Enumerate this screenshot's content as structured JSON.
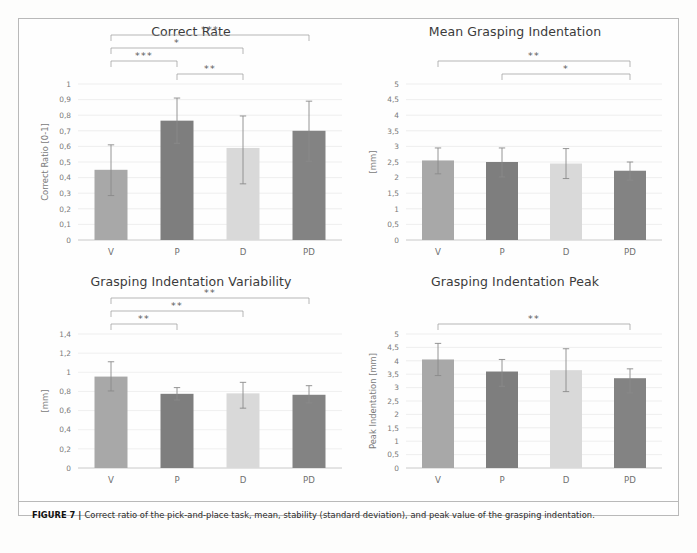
{
  "figure": {
    "caption_label": "FIGURE 7 |",
    "caption_text": "Correct ratio of the pick-and-place task, mean, stability (standard deviation), and peak value of the grasping indentation."
  },
  "palette": {
    "bar_v": "#a8a8a8",
    "bar_p": "#7e7e7e",
    "bar_d": "#d9d9d9",
    "bar_pd": "#838383",
    "grid": "#e8e8e8",
    "axis": "#c9c9c9",
    "error": "#8a8a8a",
    "bracket": "#9a9a9a",
    "text": "#7a7a7a",
    "title": "#3b3b3b"
  },
  "chart_data": [
    {
      "id": "correct-rate",
      "type": "bar",
      "title": "Correct Rate",
      "xlabel": "",
      "ylabel": "Correct Ratio [0-1]",
      "categories": [
        "V",
        "P",
        "D",
        "PD"
      ],
      "values": [
        0.45,
        0.765,
        0.59,
        0.7
      ],
      "errors_low": [
        0.165,
        0.145,
        0.23,
        0.195
      ],
      "errors_high": [
        0.16,
        0.145,
        0.205,
        0.19
      ],
      "ylim": [
        0,
        1
      ],
      "yticks": [
        0,
        0.1,
        0.2,
        0.3,
        0.4,
        0.5,
        0.6,
        0.7,
        0.8,
        0.9,
        1
      ],
      "ytick_labels": [
        "0",
        "0,1",
        "0,2",
        "0,3",
        "0,4",
        "0,5",
        "0,6",
        "0,7",
        "0,8",
        "0,9",
        "1"
      ],
      "grid": true,
      "legend": "none",
      "significance": [
        {
          "from": "V",
          "to": "PD",
          "label": "***",
          "level": 3
        },
        {
          "from": "V",
          "to": "D",
          "label": "*",
          "level": 2
        },
        {
          "from": "V",
          "to": "P",
          "label": "***",
          "level": 1
        },
        {
          "from": "P",
          "to": "D",
          "label": "**",
          "level": 0
        }
      ]
    },
    {
      "id": "mean-grasping-indentation",
      "type": "bar",
      "title": "Mean Grasping Indentation",
      "xlabel": "",
      "ylabel": "[mm]",
      "categories": [
        "V",
        "P",
        "D",
        "PD"
      ],
      "values": [
        2.55,
        2.5,
        2.45,
        2.22
      ],
      "errors_low": [
        0.43,
        0.48,
        0.48,
        0.3
      ],
      "errors_high": [
        0.4,
        0.45,
        0.48,
        0.28
      ],
      "ylim": [
        0,
        5
      ],
      "yticks": [
        0,
        0.5,
        1,
        1.5,
        2,
        2.5,
        3,
        3.5,
        4,
        4.5,
        5
      ],
      "ytick_labels": [
        "0",
        "0,5",
        "1",
        "1,5",
        "2",
        "2,5",
        "3",
        "3,5",
        "4",
        "4,5",
        "5"
      ],
      "grid": true,
      "legend": "none",
      "significance": [
        {
          "from": "V",
          "to": "PD",
          "label": "**",
          "level": 1
        },
        {
          "from": "P",
          "to": "PD",
          "label": "*",
          "level": 0
        }
      ]
    },
    {
      "id": "grasping-indentation-variability",
      "type": "bar",
      "title": "Grasping Indentation Variability",
      "xlabel": "",
      "ylabel": "[mm]",
      "categories": [
        "V",
        "P",
        "D",
        "PD"
      ],
      "values": [
        0.955,
        0.775,
        0.78,
        0.765
      ],
      "errors_low": [
        0.15,
        0.065,
        0.155,
        0.085
      ],
      "errors_high": [
        0.155,
        0.065,
        0.115,
        0.095
      ],
      "ylim": [
        0,
        1.4
      ],
      "yticks": [
        0,
        0.2,
        0.4,
        0.6,
        0.8,
        1,
        1.2,
        1.4
      ],
      "ytick_labels": [
        "0",
        "0,2",
        "0,4",
        "0,6",
        "0,8",
        "1",
        "1,2",
        "1,4"
      ],
      "grid": true,
      "legend": "none",
      "significance": [
        {
          "from": "V",
          "to": "PD",
          "label": "**",
          "level": 2
        },
        {
          "from": "V",
          "to": "D",
          "label": "**",
          "level": 1
        },
        {
          "from": "V",
          "to": "P",
          "label": "**",
          "level": 0
        }
      ]
    },
    {
      "id": "grasping-indentation-peak",
      "type": "bar",
      "title": "Grasping Indentation Peak",
      "xlabel": "",
      "ylabel": "Peak Indentation [mm]",
      "categories": [
        "V",
        "P",
        "D",
        "PD"
      ],
      "values": [
        4.05,
        3.6,
        3.65,
        3.35
      ],
      "errors_low": [
        0.6,
        0.55,
        0.8,
        0.55
      ],
      "errors_high": [
        0.6,
        0.45,
        0.8,
        0.35
      ],
      "ylim": [
        0,
        5
      ],
      "yticks": [
        0,
        0.5,
        1,
        1.5,
        2,
        2.5,
        3,
        3.5,
        4,
        4.5,
        5
      ],
      "ytick_labels": [
        "0",
        "0,5",
        "1",
        "1,5",
        "2",
        "2,5",
        "3",
        "3,5",
        "4",
        "4,5",
        "5"
      ],
      "grid": true,
      "legend": "none",
      "significance": [
        {
          "from": "V",
          "to": "PD",
          "label": "**",
          "level": 0
        }
      ]
    }
  ]
}
